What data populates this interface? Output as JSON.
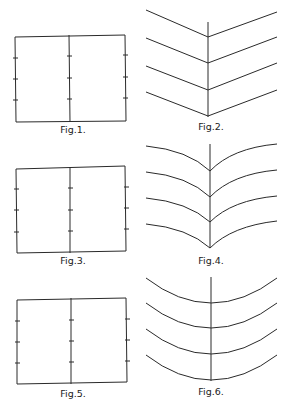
{
  "figures": [
    {
      "id": "fig1",
      "label": "Fig.1.",
      "kind": "rectangle-with-midline"
    },
    {
      "id": "fig2",
      "label": "Fig.2.",
      "kind": "chevron-lines"
    },
    {
      "id": "fig3",
      "label": "Fig.3.",
      "kind": "rectangle-with-midline"
    },
    {
      "id": "fig4",
      "label": "Fig.4.",
      "kind": "concave-cusped-curves"
    },
    {
      "id": "fig5",
      "label": "Fig.5.",
      "kind": "rectangle-with-midline"
    },
    {
      "id": "fig6",
      "label": "Fig.6.",
      "kind": "convex-arcs"
    }
  ],
  "tick_count_per_edge": 3,
  "curve_count": 4
}
